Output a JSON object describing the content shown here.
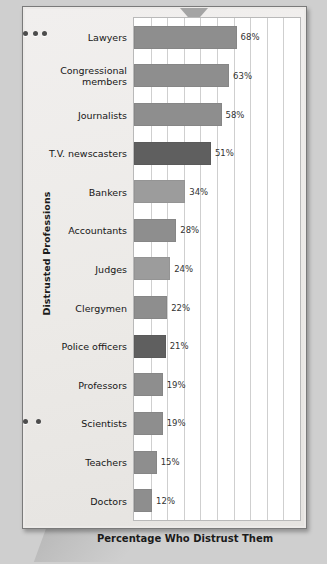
{
  "decorations": {
    "arrow_icon": "arrow-down-icon",
    "binding_icon": "spiral-binding-icon"
  },
  "chart_data": {
    "type": "bar",
    "orientation": "horizontal",
    "title": "",
    "xlabel": "Percentage Who Distrust Them",
    "ylabel": "Distrusted Professions",
    "xlim": [
      0,
      110
    ],
    "grid": true,
    "gridline_count": 9,
    "legend": "none",
    "categories": [
      "Lawyers",
      "Congressional\nmembers",
      "Journalists",
      "T.V. newscasters",
      "Bankers",
      "Accountants",
      "Judges",
      "Clergymen",
      "Police officers",
      "Professors",
      "Scientists",
      "Teachers",
      "Doctors"
    ],
    "values": [
      68,
      63,
      58,
      51,
      34,
      28,
      24,
      22,
      21,
      19,
      19,
      15,
      12
    ],
    "value_labels": [
      "68%",
      "63%",
      "58%",
      "51%",
      "34%",
      "28%",
      "24%",
      "22%",
      "21%",
      "19%",
      "19%",
      "15%",
      "12%"
    ],
    "bar_shades": [
      "mid",
      "mid",
      "mid",
      "dark",
      "light",
      "mid",
      "light",
      "mid",
      "dark",
      "mid",
      "mid",
      "mid",
      "mid"
    ],
    "colors": {
      "bar_mid": "#8e8e8e",
      "bar_dark": "#5f5f5f",
      "bar_light": "#9c9c9c",
      "plot_background": "#ffffff",
      "gridline": "#cfcfcf",
      "page_background": "#eceae8",
      "text": "#161616"
    }
  }
}
